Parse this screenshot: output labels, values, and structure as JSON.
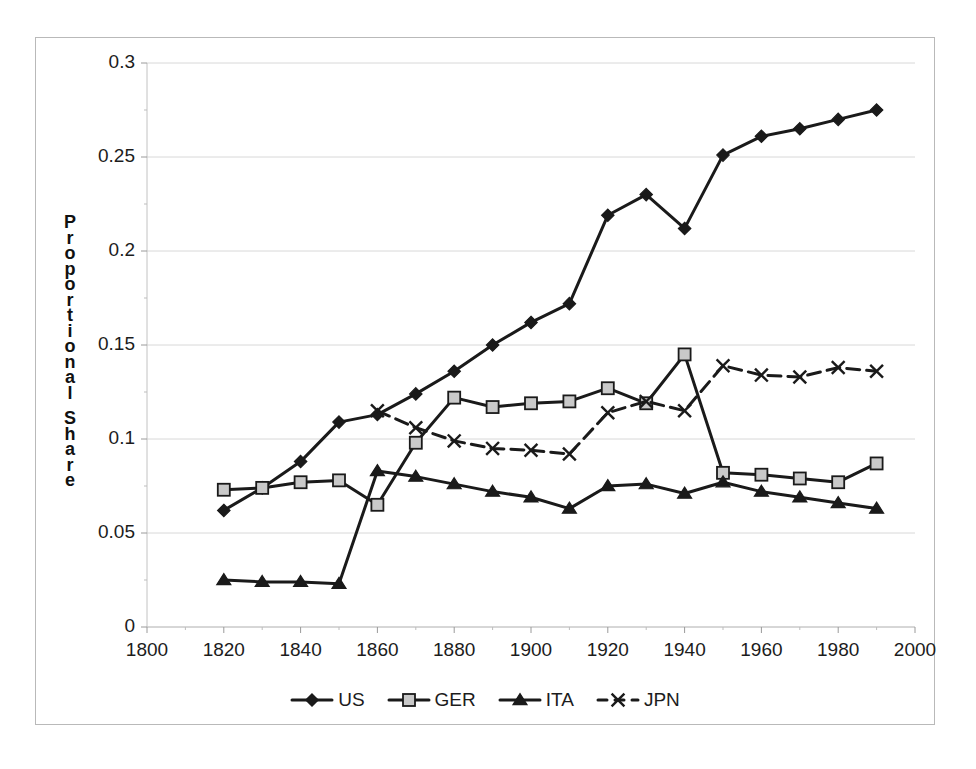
{
  "chart_data": {
    "type": "line",
    "title": "",
    "xlabel": "",
    "ylabel": "Proportional Share",
    "x": [
      1820,
      1830,
      1840,
      1850,
      1860,
      1870,
      1880,
      1890,
      1900,
      1910,
      1920,
      1930,
      1940,
      1950,
      1960,
      1970,
      1980,
      1990
    ],
    "xlim": [
      1800,
      2000
    ],
    "ylim": [
      0,
      0.3
    ],
    "xticks": [
      "1800",
      "1820",
      "1840",
      "1860",
      "1880",
      "1900",
      "1920",
      "1940",
      "1960",
      "1980",
      "2000"
    ],
    "xtick_values": [
      1800,
      1820,
      1840,
      1860,
      1880,
      1900,
      1920,
      1940,
      1960,
      1980,
      2000
    ],
    "yticks": [
      "0",
      "0.05",
      "0.1",
      "0.15",
      "0.2",
      "0.25",
      "0.3"
    ],
    "ytick_values": [
      0,
      0.05,
      0.1,
      0.15,
      0.2,
      0.25,
      0.3
    ],
    "grid": "horizontal",
    "legend_position": "bottom",
    "series": [
      {
        "name": "US",
        "marker": "diamond",
        "line": "solid",
        "color": "#1a1a1a",
        "x": [
          1820,
          1830,
          1840,
          1850,
          1860,
          1870,
          1880,
          1890,
          1900,
          1910,
          1920,
          1930,
          1940,
          1950,
          1960,
          1970,
          1980,
          1990
        ],
        "values": [
          0.062,
          0.074,
          0.088,
          0.109,
          0.113,
          0.124,
          0.136,
          0.15,
          0.162,
          0.172,
          0.219,
          0.23,
          0.212,
          0.251,
          0.261,
          0.265,
          0.27,
          0.275
        ]
      },
      {
        "name": "GER",
        "marker": "square",
        "line": "solid",
        "color": "#1a1a1a",
        "fill": "#c9c9c9",
        "x": [
          1820,
          1830,
          1840,
          1850,
          1860,
          1870,
          1880,
          1890,
          1900,
          1910,
          1920,
          1930,
          1940,
          1950,
          1960,
          1970,
          1980,
          1990
        ],
        "values": [
          0.073,
          0.074,
          0.077,
          0.078,
          0.065,
          0.098,
          0.122,
          0.117,
          0.119,
          0.12,
          0.127,
          0.119,
          0.145,
          0.082,
          0.081,
          0.079,
          0.077,
          0.087
        ]
      },
      {
        "name": "ITA",
        "marker": "triangle",
        "line": "solid",
        "color": "#1a1a1a",
        "x": [
          1820,
          1830,
          1840,
          1850,
          1860,
          1870,
          1880,
          1890,
          1900,
          1910,
          1920,
          1930,
          1940,
          1950,
          1960,
          1970,
          1980,
          1990
        ],
        "values": [
          0.025,
          0.024,
          0.024,
          0.023,
          0.083,
          0.08,
          0.076,
          0.072,
          0.069,
          0.063,
          0.075,
          0.076,
          0.071,
          0.077,
          0.072,
          0.069,
          0.066,
          0.063
        ]
      },
      {
        "name": "JPN",
        "marker": "cross",
        "line": "dashed",
        "color": "#1a1a1a",
        "x": [
          1860,
          1870,
          1880,
          1890,
          1900,
          1910,
          1920,
          1930,
          1940,
          1950,
          1960,
          1970,
          1980,
          1990
        ],
        "values": [
          0.115,
          0.106,
          0.099,
          0.095,
          0.094,
          0.092,
          0.114,
          0.12,
          0.115,
          0.139,
          0.134,
          0.133,
          0.138,
          0.136
        ]
      }
    ]
  },
  "axis": {
    "y_title_chars": [
      "P",
      "r",
      "o",
      "p",
      "o",
      "r",
      "t",
      "i",
      "o",
      "n",
      "a",
      "l",
      "",
      "S",
      "h",
      "a",
      "r",
      "e"
    ]
  },
  "colors": {
    "ink": "#1a1a1a",
    "grid": "#d8d8d8",
    "frame": "#b9b9b9",
    "marker_fill": "#c9c9c9"
  }
}
